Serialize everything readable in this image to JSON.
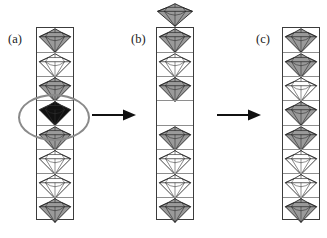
{
  "figure": {
    "width": 327,
    "height": 238,
    "background": "#ffffff"
  },
  "colors": {
    "gem_gray_fill": "#9a9a9a",
    "gem_white_fill": "#ffffff",
    "gem_black_fill": "#111111",
    "gem_outline": "#1a1a1a",
    "gem_facet_line": "#1a1a1a",
    "column_border": "#3c3c3c",
    "cell_divider": "#8e8e8e",
    "oval_highlight": "#8a8a8a",
    "arrow": "#111111",
    "label_text": "#1a1a1a"
  },
  "panels": [
    {
      "id": "a",
      "label": "(a)",
      "label_x": 8,
      "label_y": 33,
      "column_x": 36,
      "column_y": 27,
      "column_w": 38,
      "column_h": 193,
      "cell_count": 8,
      "cells": [
        {
          "index": 0,
          "fill": "gray",
          "gem": true,
          "name": "gem-gray"
        },
        {
          "index": 1,
          "fill": "white",
          "gem": true,
          "name": "gem-white"
        },
        {
          "index": 2,
          "fill": "gray",
          "gem": true,
          "name": "gem-gray"
        },
        {
          "index": 3,
          "fill": "black",
          "gem": true,
          "name": "gem-black-defect"
        },
        {
          "index": 4,
          "fill": "gray",
          "gem": true,
          "name": "gem-gray"
        },
        {
          "index": 5,
          "fill": "white",
          "gem": true,
          "name": "gem-white"
        },
        {
          "index": 6,
          "fill": "white",
          "gem": true,
          "name": "gem-white"
        },
        {
          "index": 7,
          "fill": "gray",
          "gem": true,
          "name": "gem-gray"
        }
      ],
      "highlight_oval": {
        "present": true,
        "x": 18,
        "y": 94,
        "w": 72,
        "h": 47,
        "target_cell_index": 3
      },
      "loose_gem": {
        "present": false
      }
    },
    {
      "id": "b",
      "label": "(b)",
      "label_x": 131,
      "label_y": 33,
      "column_x": 156,
      "column_y": 27,
      "column_w": 38,
      "column_h": 193,
      "cell_count": 8,
      "cells": [
        {
          "index": 0,
          "fill": "gray",
          "gem": true,
          "name": "gem-gray"
        },
        {
          "index": 1,
          "fill": "white",
          "gem": true,
          "name": "gem-white"
        },
        {
          "index": 2,
          "fill": "gray",
          "gem": true,
          "name": "gem-gray"
        },
        {
          "index": 3,
          "fill": "none",
          "gem": false,
          "name": "empty-cell-vacancy"
        },
        {
          "index": 4,
          "fill": "gray",
          "gem": true,
          "name": "gem-gray"
        },
        {
          "index": 5,
          "fill": "white",
          "gem": true,
          "name": "gem-white"
        },
        {
          "index": 6,
          "fill": "white",
          "gem": true,
          "name": "gem-white"
        },
        {
          "index": 7,
          "fill": "gray",
          "gem": true,
          "name": "gem-gray"
        }
      ],
      "highlight_oval": {
        "present": false
      },
      "loose_gem": {
        "present": true,
        "fill": "gray",
        "x": 156,
        "y": 3,
        "w": 38,
        "h": 24,
        "name": "gem-gray-ejected"
      }
    },
    {
      "id": "c",
      "label": "(c)",
      "label_x": 256,
      "label_y": 33,
      "column_x": 282,
      "column_y": 27,
      "column_w": 38,
      "column_h": 193,
      "cell_count": 8,
      "cells": [
        {
          "index": 0,
          "fill": "gray",
          "gem": true,
          "name": "gem-gray"
        },
        {
          "index": 1,
          "fill": "gray",
          "gem": true,
          "name": "gem-gray"
        },
        {
          "index": 2,
          "fill": "white",
          "gem": true,
          "name": "gem-white"
        },
        {
          "index": 3,
          "fill": "gray",
          "gem": true,
          "name": "gem-gray"
        },
        {
          "index": 4,
          "fill": "gray",
          "gem": true,
          "name": "gem-gray"
        },
        {
          "index": 5,
          "fill": "white",
          "gem": true,
          "name": "gem-white"
        },
        {
          "index": 6,
          "fill": "white",
          "gem": true,
          "name": "gem-white"
        },
        {
          "index": 7,
          "fill": "gray",
          "gem": true,
          "name": "gem-gray"
        }
      ],
      "highlight_oval": {
        "present": false
      },
      "loose_gem": {
        "present": false
      }
    }
  ],
  "arrows": [
    {
      "id": "arrow-1",
      "x": 92,
      "y": 108,
      "w": 44,
      "h": 14,
      "direction": "right"
    },
    {
      "id": "arrow-2",
      "x": 216,
      "y": 108,
      "w": 46,
      "h": 14,
      "direction": "right"
    }
  ]
}
